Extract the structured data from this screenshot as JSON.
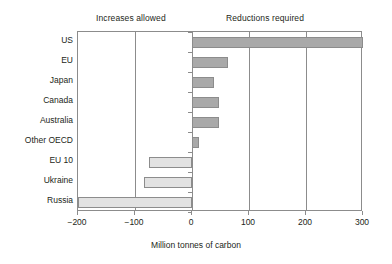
{
  "chart_data": {
    "type": "bar",
    "orientation": "horizontal",
    "title": "",
    "xlabel": "Million tonnes of carbon",
    "ylabel": "",
    "xlim": [
      -200,
      300
    ],
    "xticks": [
      -200,
      -100,
      0,
      100,
      200,
      300
    ],
    "xtick_labels": [
      "−200",
      "−100",
      "0",
      "100",
      "200",
      "300"
    ],
    "grid": true,
    "categories": [
      "US",
      "EU",
      "Japan",
      "Canada",
      "Australia",
      "Other OECD",
      "EU 10",
      "Ukraine",
      "Russia"
    ],
    "values": [
      300,
      63,
      38,
      48,
      48,
      12,
      -75,
      -85,
      -200
    ],
    "annotations": [
      {
        "text": "Increases allowed",
        "side": "left"
      },
      {
        "text": "Reductions required",
        "side": "right"
      }
    ],
    "colors": {
      "positive_bar": "#a9a9a9",
      "negative_bar": "#e2e2e2",
      "bar_border": "#8c8c8c",
      "axis": "#8c8c8c",
      "text": "#231f20",
      "background": "#ffffff"
    }
  }
}
